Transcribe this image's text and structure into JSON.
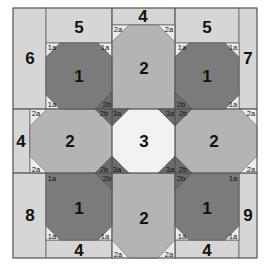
{
  "diagram": {
    "title": "",
    "colors": {
      "background_strip": "#d6d6d6",
      "light_octagon": "#b4b4b4",
      "dark_octagon": "#7b7b7b",
      "center_square": "#f2f2f2",
      "corner_triangle": "#ececec",
      "dark_diamond": "#6c6c6c",
      "outline": "#555555"
    },
    "pieces": {
      "p6": "6",
      "p5_left": "5",
      "p4_top": "4",
      "p5_right": "5",
      "p7": "7",
      "p1_top_left": "1",
      "p2_top": "2",
      "p1_top_right": "1",
      "p4_left": "4",
      "p2_left": "2",
      "p3_center": "3",
      "p2_right": "2",
      "p8": "8",
      "p1_bottom_left": "1",
      "p2_bottom": "2",
      "p1_bottom_right": "1",
      "p9": "9",
      "p4_bottom_left": "4",
      "p4_bottom_right": "4"
    },
    "triangles": {
      "t1a": "1a",
      "t2a": "2a",
      "t2b": "2b",
      "t3a": "3a"
    }
  }
}
